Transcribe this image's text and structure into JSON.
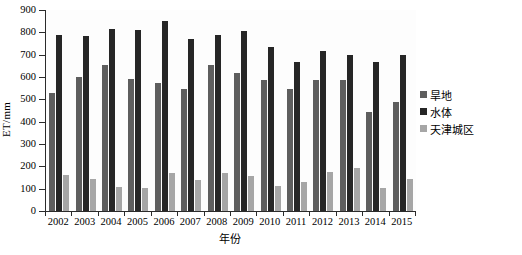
{
  "chart_data": {
    "type": "bar",
    "title": "",
    "xlabel": "年份",
    "ylabel": "ET/mm",
    "ylim": [
      0,
      900
    ],
    "ytick_step": 100,
    "yticks": [
      0,
      100,
      200,
      300,
      400,
      500,
      600,
      700,
      800,
      900
    ],
    "grid": false,
    "legend_position": "right",
    "categories": [
      "2002",
      "2003",
      "2004",
      "2005",
      "2006",
      "2007",
      "2008",
      "2009",
      "2010",
      "2011",
      "2012",
      "2013",
      "2014",
      "2015"
    ],
    "series": [
      {
        "name": "旱地",
        "color": "#5e5e5e",
        "values": [
          530,
          600,
          655,
          590,
          575,
          545,
          655,
          620,
          585,
          548,
          585,
          588,
          445,
          487
        ]
      },
      {
        "name": "水体",
        "color": "#262626",
        "values": [
          790,
          785,
          813,
          812,
          850,
          772,
          790,
          805,
          735,
          667,
          715,
          697,
          665,
          700
        ]
      },
      {
        "name": "天津城区",
        "color": "#a6a6a6",
        "values": [
          163,
          143,
          108,
          105,
          170,
          140,
          170,
          155,
          110,
          130,
          175,
          192,
          105,
          143
        ]
      }
    ]
  }
}
